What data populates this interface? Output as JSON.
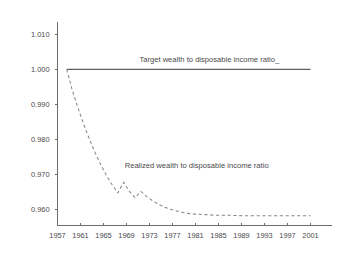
{
  "chart_data": {
    "type": "line",
    "title": "",
    "xlabel": "",
    "ylabel": "",
    "xlim": [
      1957,
      2001
    ],
    "ylim": [
      0.9555,
      1.0125
    ],
    "grid": false,
    "legend_position": "inline-annotations",
    "x_ticks": [
      1957,
      1961,
      1965,
      1969,
      1973,
      1977,
      1981,
      1985,
      1989,
      1993,
      1997,
      2001
    ],
    "x_tick_labels": [
      "1957",
      "1961",
      "1965",
      "1969",
      "1973",
      "1977",
      "1981",
      "1985",
      "1989",
      "1993",
      "1997",
      "2001"
    ],
    "y_ticks": [
      0.96,
      0.97,
      0.98,
      0.99,
      1.0,
      1.01
    ],
    "y_tick_labels": [
      "0.960",
      "0.970",
      "0.980",
      "0.990",
      "1.000",
      "1.010"
    ],
    "series": [
      {
        "name": "Target wealth to disposable income ratio",
        "style": "solid",
        "color": "#5f5f5f",
        "x": [
          1958.6,
          2001
        ],
        "values": [
          1.0,
          1.0
        ]
      },
      {
        "name": "Realized wealth to disposable income ratio",
        "style": "dashed",
        "color": "#8a8494",
        "x": [
          1958.6,
          1959.5,
          1960.5,
          1961.5,
          1962.5,
          1963.5,
          1964.5,
          1965.5,
          1966.5,
          1967.5,
          1968.5,
          1969.5,
          1970.5,
          1971.5,
          1972.5,
          1973.5,
          1974.5,
          1975.5,
          1976.5,
          1977.5,
          1978.5,
          1979.5,
          1980.5,
          1981.5,
          1982.5,
          1983.5,
          1985,
          1987,
          1989,
          1991,
          1993,
          1995,
          1997,
          1999,
          2001
        ],
        "values": [
          1.0,
          0.9945,
          0.9893,
          0.9846,
          0.9803,
          0.9764,
          0.9729,
          0.9698,
          0.9671,
          0.9648,
          0.9678,
          0.9652,
          0.9634,
          0.9652,
          0.9638,
          0.9626,
          0.9616,
          0.9608,
          0.9602,
          0.9597,
          0.9593,
          0.959,
          0.9588,
          0.9587,
          0.9586,
          0.9585,
          0.9584,
          0.9584,
          0.9583,
          0.9583,
          0.9583,
          0.9583,
          0.9583,
          0.9583,
          0.9583
        ]
      }
    ],
    "annotations": [
      {
        "text": "Target wealth to disposable income ratio_",
        "x": 1983.4,
        "y": 1.0022,
        "name": "target-series-annotation"
      },
      {
        "text": "Realized wealth to disposable income ratio",
        "x": 1981.2,
        "y": 0.9719,
        "name": "realized-series-annotation"
      }
    ]
  },
  "colors": {
    "background": "#ffffff",
    "axis": "#6d6d6d",
    "text": "#4a4a4a",
    "target_line": "#5f5f5f",
    "realized_line": "#8a8494"
  }
}
